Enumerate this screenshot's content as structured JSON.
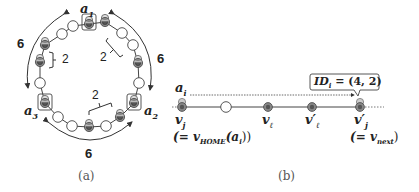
{
  "figure_a": {
    "caption": "(a)",
    "agent_labels": {
      "a1": "a",
      "a1_sub": "1",
      "a2": "a",
      "a2_sub": "2",
      "a3": "a",
      "a3_sub": "3"
    },
    "arc_distances": [
      "6",
      "6",
      "6"
    ],
    "bracket_gaps": [
      "2",
      "2",
      "2"
    ],
    "ring_nodes": 18,
    "home_nodes": [
      "a1",
      "a2",
      "a3"
    ]
  },
  "figure_b": {
    "caption": "(b)",
    "agent_label": "a",
    "agent_sub": "i",
    "id_box": {
      "text_main": "ID",
      "text_sub": "i",
      "text_value": " = (4, 2)"
    },
    "nodes": [
      {
        "label": "v",
        "sub": "j",
        "prime": "",
        "note": "(= v",
        "note_sub": "HOME",
        "note_tail": "(a",
        "note_tail_sub": "i",
        "note_end": "))"
      },
      {
        "label": "",
        "sub": ""
      },
      {
        "label": "v",
        "sub": "ℓ",
        "prime": ""
      },
      {
        "label": "v",
        "sub": "ℓ",
        "prime": "′"
      },
      {
        "label": "v",
        "sub": "j",
        "prime": "′",
        "note": "(= v",
        "note_sub": "next",
        "note_end": ")"
      }
    ]
  },
  "colors": {
    "line": "#444444",
    "agent_fill": "#777777",
    "agent_light": "#cccccc",
    "empty_fill": "#ffffff",
    "text": "#222222"
  }
}
